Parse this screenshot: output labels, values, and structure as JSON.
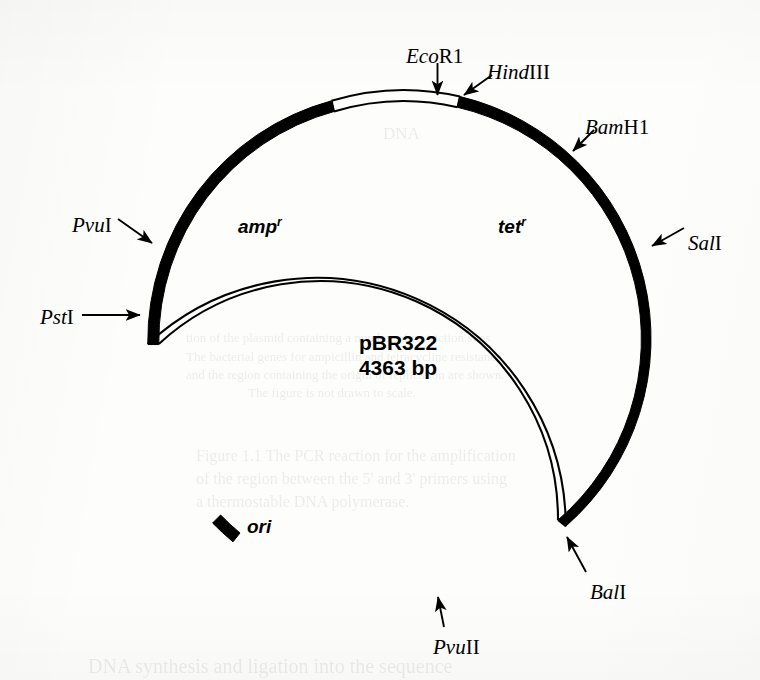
{
  "figure": {
    "kind": "plasmid-map",
    "plasmid_name": "pBR322",
    "plasmid_size": "4363 bp",
    "background_color": "#fdfdfc",
    "ink_color": "#000000"
  },
  "center_labels": {
    "amp_gene": "amp",
    "amp_superscript": "r",
    "tet_gene": "tet",
    "tet_superscript": "r",
    "ori_label": "ori"
  },
  "restriction_sites": [
    {
      "id": "ecor1",
      "name_italic": "Eco",
      "name_roman": "R1",
      "angle_deg": 280.5,
      "label_x": 406,
      "label_y": 46,
      "arrow": "down"
    },
    {
      "id": "hindiii",
      "name_italic": "Hind",
      "name_roman": "III",
      "angle_deg": 285.0,
      "label_x": 487,
      "label_y": 62,
      "arrow": "diag"
    },
    {
      "id": "bamh1",
      "name_italic": "Bam",
      "name_roman": "H1",
      "angle_deg": 320.0,
      "label_x": 585,
      "label_y": 117,
      "arrow": "diag"
    },
    {
      "id": "sali",
      "name_italic": "Sal",
      "name_roman": "I",
      "angle_deg": 352.0,
      "label_x": 688,
      "label_y": 233,
      "arrow": "diag"
    },
    {
      "id": "bali",
      "name_italic": "Bal",
      "name_roman": "I",
      "angle_deg": 47.0,
      "label_x": 590,
      "label_y": 582,
      "arrow": "diag"
    },
    {
      "id": "pvuii",
      "name_italic": "Pvu",
      "name_roman": "II",
      "angle_deg": 80.0,
      "label_x": 433,
      "label_y": 637,
      "arrow": "up"
    },
    {
      "id": "pvui",
      "name_italic": "Pvu",
      "name_roman": "I",
      "angle_deg": 198.0,
      "label_x": 72,
      "label_y": 215,
      "arrow": "diag"
    },
    {
      "id": "psti",
      "name_italic": "Pst",
      "name_roman": "I",
      "angle_deg": 182.0,
      "label_x": 40,
      "label_y": 307,
      "arrow": "right"
    }
  ],
  "chart_data": {
    "type": "plasmid-circle",
    "title": "pBR322 4363 bp",
    "circle": {
      "cx": 396,
      "cy": 344,
      "r": 249
    },
    "arcs": [
      {
        "name": "tet-r-region",
        "style": "filled",
        "start_deg": 285,
        "end_deg": 47,
        "note": "thick black arc from HindIII clockwise through BamH1 and SalI to BalI"
      },
      {
        "name": "ori-to-psti",
        "style": "outline",
        "start_deg": 47,
        "end_deg": 182,
        "note": "thin double-line arc through PvuII and ori up to PstI"
      },
      {
        "name": "amp-r-region",
        "style": "filled",
        "start_deg": 182,
        "end_deg": 261,
        "note": "thick black arc from PstI through PvuI to the EcoR1 white window"
      },
      {
        "name": "ecor1-window",
        "style": "outline",
        "start_deg": 261,
        "end_deg": 285,
        "note": "thin double-line window containing the EcoR1 site at the top"
      }
    ],
    "markers": [
      {
        "name": "ori-marker",
        "angle_deg": 118,
        "style": "short-filled-block"
      }
    ],
    "gene_labels": [
      {
        "text": "amp r",
        "x": 255,
        "y": 229
      },
      {
        "text": "tet r",
        "x": 503,
        "y": 229
      },
      {
        "text": "ori",
        "x": 249,
        "y": 527
      }
    ]
  },
  "ghost_text": [
    {
      "text": "DNA",
      "x": 383,
      "y": 124,
      "size": 17
    },
    {
      "text": "tion of the plasmid containing a number of restriction sites",
      "x": 186,
      "y": 330,
      "size": 13
    },
    {
      "text": "The bacterial genes for ampicillin and tetracycline resistance",
      "x": 186,
      "y": 349,
      "size": 13
    },
    {
      "text": "and the region containing the origin of replication are shown.",
      "x": 186,
      "y": 367,
      "size": 13
    },
    {
      "text": "The figure is not drawn to scale.",
      "x": 248,
      "y": 385,
      "size": 13
    },
    {
      "text": "Figure 1.1   The PCR reaction for the amplification",
      "x": 196,
      "y": 447,
      "size": 16
    },
    {
      "text": "of the region between the 5' and 3' primers using",
      "x": 196,
      "y": 470,
      "size": 16
    },
    {
      "text": "a thermostable DNA polymerase.",
      "x": 196,
      "y": 493,
      "size": 16
    },
    {
      "text": "DNA synthesis and ligation into the sequence",
      "x": 88,
      "y": 655,
      "size": 20
    }
  ]
}
